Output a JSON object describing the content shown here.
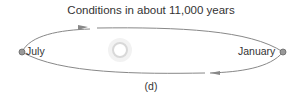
{
  "title": "Conditions in about 11,000 years",
  "labels": {
    "left": "July",
    "right": "January"
  },
  "caption": "(d)",
  "icons": {
    "sun": "sun-icon",
    "earth_left": "earth-icon",
    "earth_right": "earth-icon"
  },
  "colors": {
    "orbit": "#888888",
    "text": "#333333",
    "sun": "#dddddd"
  }
}
